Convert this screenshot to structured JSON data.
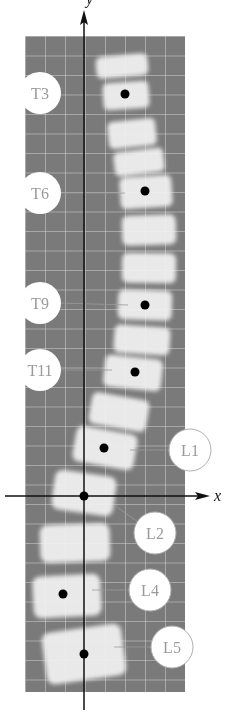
{
  "figure": {
    "axes": {
      "x_label": "x",
      "y_label": "y",
      "origin_px": [
        84,
        496
      ]
    },
    "colors": {
      "panel": "#7a7a7a",
      "grid": "#d8d8d8",
      "bone": "#f2f2f2",
      "axis": "#111111",
      "dot": "#000000",
      "label_fill": "#ffffff",
      "label_text": "#9a9a9a",
      "label_stroke": "#b0b0b0"
    },
    "labels": [
      {
        "id": "T3",
        "text": "T3",
        "cx": 40,
        "cy": 93,
        "dot": [
          125,
          94
        ]
      },
      {
        "id": "T6",
        "text": "T6",
        "cx": 40,
        "cy": 193,
        "dot": [
          145,
          191
        ]
      },
      {
        "id": "T9",
        "text": "T9",
        "cx": 40,
        "cy": 303,
        "dot": [
          145,
          305
        ]
      },
      {
        "id": "T11",
        "text": "T11",
        "cx": 40,
        "cy": 370,
        "dot": [
          135,
          372
        ]
      },
      {
        "id": "L1",
        "text": "L1",
        "cx": 190,
        "cy": 450,
        "dot": [
          104,
          448
        ]
      },
      {
        "id": "L2",
        "text": "L2",
        "cx": 155,
        "cy": 533,
        "dot": null
      },
      {
        "id": "L4",
        "text": "L4",
        "cx": 150,
        "cy": 590,
        "dot": [
          63,
          594
        ]
      },
      {
        "id": "L5",
        "text": "L5",
        "cx": 172,
        "cy": 647,
        "dot": [
          84,
          654
        ]
      }
    ],
    "origin_dot": [
      84,
      496
    ]
  }
}
